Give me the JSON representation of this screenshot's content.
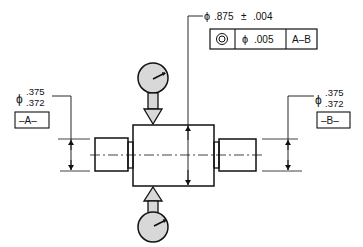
{
  "drawing": {
    "type": "gd&t-concentricity-inspection",
    "main_dimension": {
      "diameter_symbol": "ϕ",
      "value": ".875",
      "tolerance_symbol": "±",
      "tolerance": ".004"
    },
    "feature_control_frame": {
      "characteristic_symbol": "concentricity-icon",
      "tolerance_diameter_symbol": "ϕ",
      "tolerance_value": ".005",
      "datum_reference": "A–B"
    },
    "left_journal": {
      "diameter_symbol": "ϕ",
      "upper_limit": ".375",
      "lower_limit": ".372",
      "datum_label": "–A–"
    },
    "right_journal": {
      "diameter_symbol": "ϕ",
      "upper_limit": ".375",
      "lower_limit": ".372",
      "datum_label": "–B–"
    },
    "indicators": [
      {
        "position": "top",
        "icon": "dial-indicator-icon"
      },
      {
        "position": "bottom",
        "icon": "dial-indicator-icon"
      }
    ],
    "colors": {
      "line": "#111111",
      "indicator_fill": "#d8d8d8",
      "background": "#ffffff"
    }
  }
}
